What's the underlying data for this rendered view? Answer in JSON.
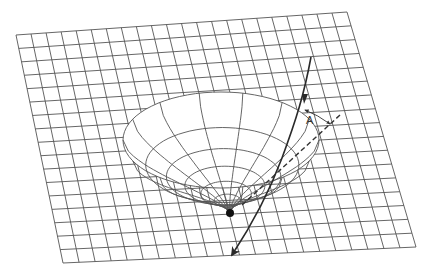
{
  "figure": {
    "colors": {
      "background": "#ffffff",
      "grid": "#555555",
      "funnel": "#555555",
      "trajectory": "#2a2a2a",
      "central_mass": "#111111"
    },
    "labels": {
      "angle_label": "A"
    },
    "sheet": {
      "corners": {
        "top_left": [
          16,
          35
        ],
        "top_right": [
          347,
          12
        ],
        "bottom_right": [
          416,
          247
        ],
        "bottom_left": [
          63,
          263
        ]
      },
      "cols": 22,
      "rows": 17
    },
    "funnel": {
      "center": [
        221,
        140
      ],
      "rim_rx": 98,
      "rim_ry": 48,
      "bottom": [
        230,
        213
      ],
      "rings": 7,
      "meridians": 14
    },
    "trajectory": {
      "icon": "arrow-icon",
      "style": "solid",
      "description": "Incoming path bending around the mass"
    },
    "undeflected_path": {
      "style": "dashed",
      "description": "Straight-line path without deflection"
    }
  }
}
